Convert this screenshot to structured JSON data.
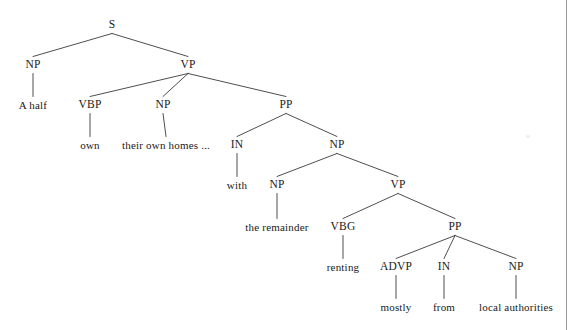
{
  "figure": {
    "kind": "constituency-parse-tree",
    "width": 577,
    "height": 330,
    "background_color": "#ffffff",
    "line_color": "#3a3a3a",
    "text_color": "#1a1a1a",
    "rule_color": "#9a9a9a"
  },
  "nodes": [
    {
      "id": "n0",
      "label": "S",
      "x": 112,
      "y": 25,
      "type": "nonterminal"
    },
    {
      "id": "n1",
      "label": "NP",
      "x": 33,
      "y": 65,
      "type": "nonterminal"
    },
    {
      "id": "n2",
      "label": "VP",
      "x": 188,
      "y": 65,
      "type": "nonterminal"
    },
    {
      "id": "n3",
      "label": "A half",
      "x": 33,
      "y": 105,
      "type": "terminal"
    },
    {
      "id": "n4",
      "label": "VBP",
      "x": 90,
      "y": 105,
      "type": "nonterminal"
    },
    {
      "id": "n5",
      "label": "NP",
      "x": 163,
      "y": 105,
      "type": "nonterminal"
    },
    {
      "id": "n6",
      "label": "PP",
      "x": 286,
      "y": 105,
      "type": "nonterminal"
    },
    {
      "id": "n7",
      "label": "own",
      "x": 90,
      "y": 145,
      "type": "terminal"
    },
    {
      "id": "n8",
      "label": "their own homes ...",
      "x": 166,
      "y": 145,
      "type": "terminal"
    },
    {
      "id": "n9",
      "label": "IN",
      "x": 237,
      "y": 145,
      "type": "nonterminal"
    },
    {
      "id": "n10",
      "label": "NP",
      "x": 337,
      "y": 145,
      "type": "nonterminal"
    },
    {
      "id": "n11",
      "label": "with",
      "x": 237,
      "y": 185,
      "type": "terminal"
    },
    {
      "id": "n12",
      "label": "NP",
      "x": 277,
      "y": 185,
      "type": "nonterminal"
    },
    {
      "id": "n13",
      "label": "VP",
      "x": 398,
      "y": 185,
      "type": "nonterminal"
    },
    {
      "id": "n14",
      "label": "the remainder",
      "x": 277,
      "y": 227,
      "type": "terminal"
    },
    {
      "id": "n15",
      "label": "VBG",
      "x": 343,
      "y": 227,
      "type": "nonterminal"
    },
    {
      "id": "n16",
      "label": "PP",
      "x": 455,
      "y": 227,
      "type": "nonterminal"
    },
    {
      "id": "n17",
      "label": "renting",
      "x": 343,
      "y": 267,
      "type": "terminal"
    },
    {
      "id": "n18",
      "label": "ADVP",
      "x": 396,
      "y": 267,
      "type": "nonterminal"
    },
    {
      "id": "n19",
      "label": "IN",
      "x": 444,
      "y": 267,
      "type": "nonterminal"
    },
    {
      "id": "n20",
      "label": "NP",
      "x": 516,
      "y": 267,
      "type": "nonterminal"
    },
    {
      "id": "n21",
      "label": "mostly",
      "x": 396,
      "y": 307,
      "type": "terminal"
    },
    {
      "id": "n22",
      "label": "from",
      "x": 444,
      "y": 307,
      "type": "terminal"
    },
    {
      "id": "n23",
      "label": "local authorities",
      "x": 516,
      "y": 307,
      "type": "terminal"
    }
  ],
  "edges": [
    {
      "from": "n0",
      "to": "n1"
    },
    {
      "from": "n0",
      "to": "n2"
    },
    {
      "from": "n1",
      "to": "n3"
    },
    {
      "from": "n2",
      "to": "n4"
    },
    {
      "from": "n2",
      "to": "n5"
    },
    {
      "from": "n2",
      "to": "n6"
    },
    {
      "from": "n4",
      "to": "n7"
    },
    {
      "from": "n5",
      "to": "n8"
    },
    {
      "from": "n6",
      "to": "n9"
    },
    {
      "from": "n6",
      "to": "n10"
    },
    {
      "from": "n9",
      "to": "n11"
    },
    {
      "from": "n10",
      "to": "n12"
    },
    {
      "from": "n10",
      "to": "n13"
    },
    {
      "from": "n12",
      "to": "n14"
    },
    {
      "from": "n13",
      "to": "n15"
    },
    {
      "from": "n13",
      "to": "n16"
    },
    {
      "from": "n15",
      "to": "n17"
    },
    {
      "from": "n16",
      "to": "n18"
    },
    {
      "from": "n16",
      "to": "n19"
    },
    {
      "from": "n16",
      "to": "n20"
    },
    {
      "from": "n18",
      "to": "n21"
    },
    {
      "from": "n19",
      "to": "n22"
    },
    {
      "from": "n20",
      "to": "n23"
    }
  ],
  "sentence": "A half own their own homes ... with the remainder renting mostly from local authorities"
}
